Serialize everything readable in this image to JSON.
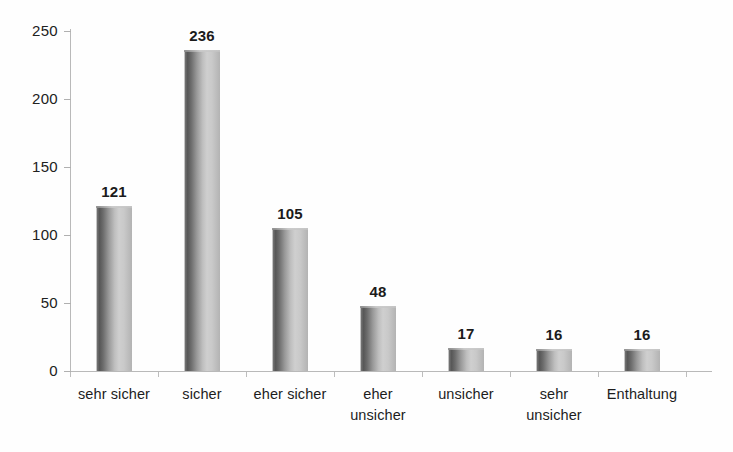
{
  "chart_data": {
    "type": "bar",
    "title": "",
    "subtitle": "",
    "xlabel": "",
    "ylabel": "",
    "categories": [
      "sehr sicher",
      "sicher",
      "eher sicher",
      "eher unsicher",
      "unsicher",
      "sehr unsicher",
      "Enthaltung"
    ],
    "category_lines": [
      [
        "sehr sicher"
      ],
      [
        "sicher"
      ],
      [
        "eher sicher"
      ],
      [
        "eher",
        "unsicher"
      ],
      [
        "unsicher"
      ],
      [
        "sehr",
        "unsicher"
      ],
      [
        "Enthaltung"
      ]
    ],
    "values": [
      121,
      236,
      105,
      48,
      17,
      16,
      16
    ],
    "value_labels": [
      "121",
      "236",
      "105",
      "48",
      "17",
      "16",
      "16"
    ],
    "ylim": [
      0,
      250
    ],
    "yticks": [
      0,
      50,
      100,
      150,
      200,
      250
    ],
    "ytick_labels": [
      "0",
      "50",
      "100",
      "150",
      "200",
      "250"
    ],
    "grid": false,
    "legend": null,
    "legend_position": "none",
    "bar_style": "cylinder-gradient",
    "colors": {
      "bar_dark": "#575757",
      "bar_light": "#cfcfcf",
      "axis": "#b9b9b9",
      "text": "#1d1d1d",
      "background": "#ffffff"
    }
  }
}
